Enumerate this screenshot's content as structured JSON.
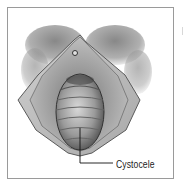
{
  "figure": {
    "style": "grayscale medical illustration",
    "callouts": [
      {
        "label": "Cystocele"
      }
    ]
  }
}
